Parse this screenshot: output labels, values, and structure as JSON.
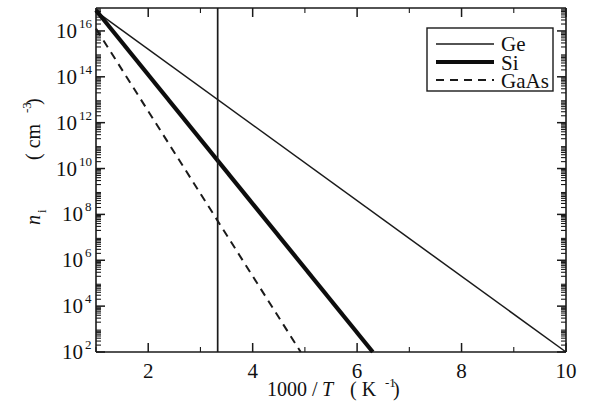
{
  "chart_data": {
    "type": "line",
    "title": "",
    "xlabel": "1000 / T  ( K⁻¹ )",
    "xlabel_parts": {
      "numerator": "1000 /",
      "variable": "T",
      "unit_open": "( K",
      "unit_exp": "-1",
      "unit_close": " )"
    },
    "ylabel": "n_i  ( cm⁻³ )",
    "ylabel_parts": {
      "symbol": "n",
      "symbol_sub": "i",
      "unit_open": "( cm",
      "unit_exp": "-3",
      "unit_close": " )"
    },
    "xlim": [
      1,
      10
    ],
    "ylim_exponents": [
      2,
      17
    ],
    "yscale": "log",
    "xscale": "linear",
    "grid": false,
    "legend_position": "top-right",
    "x_ticks_major": [
      2,
      4,
      6,
      8,
      10
    ],
    "x_tick_labels": [
      "2",
      "4",
      "6",
      "8",
      "10"
    ],
    "x_ticks_minor": [
      1,
      3,
      5,
      7,
      9
    ],
    "y_ticks_major_exponents": [
      2,
      4,
      6,
      8,
      10,
      12,
      14,
      16
    ],
    "y_tick_labels": [
      {
        "mantissa": "10",
        "exponent": "2"
      },
      {
        "mantissa": "10",
        "exponent": "4"
      },
      {
        "mantissa": "10",
        "exponent": "6"
      },
      {
        "mantissa": "10",
        "exponent": "8"
      },
      {
        "mantissa": "10",
        "exponent": "10"
      },
      {
        "mantissa": "10",
        "exponent": "12"
      },
      {
        "mantissa": "10",
        "exponent": "14"
      },
      {
        "mantissa": "10",
        "exponent": "16"
      }
    ],
    "annotations": [
      {
        "name": "room-temperature-line",
        "type": "vline",
        "x": 3.33,
        "label": ""
      }
    ],
    "series": [
      {
        "name": "Ge",
        "style": "thin-solid",
        "color": "#1a1a1a",
        "points": [
          {
            "x": 1.0,
            "y_exp": 16.85
          },
          {
            "x": 10.0,
            "y_exp": 2.0
          }
        ]
      },
      {
        "name": "Si",
        "style": "thick-solid",
        "color": "#0d0d0d",
        "points": [
          {
            "x": 1.0,
            "y_exp": 16.9
          },
          {
            "x": 6.3,
            "y_exp": 2.0
          }
        ]
      },
      {
        "name": "GaAs",
        "style": "dashed",
        "color": "#1a1a1a",
        "points": [
          {
            "x": 1.0,
            "y_exp": 16.1
          },
          {
            "x": 4.92,
            "y_exp": 2.0
          }
        ]
      }
    ]
  },
  "legend": {
    "entries": [
      {
        "label": "Ge",
        "style": "thin-solid"
      },
      {
        "label": "Si",
        "style": "thick-solid"
      },
      {
        "label": "GaAs",
        "style": "dashed"
      }
    ]
  }
}
